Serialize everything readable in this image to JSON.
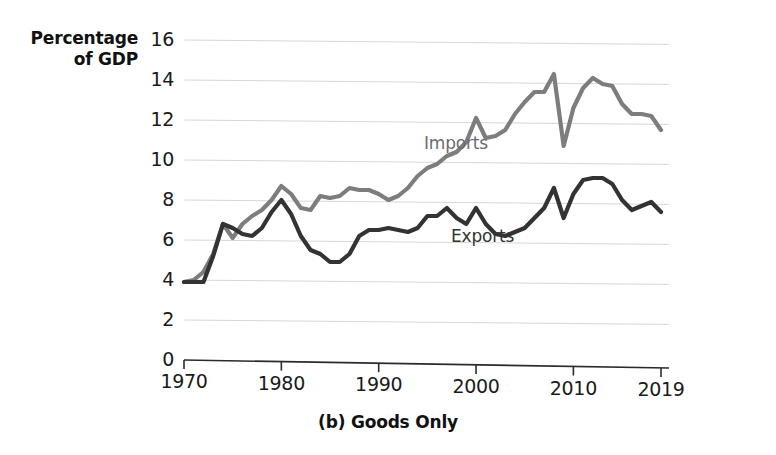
{
  "chart_data": {
    "type": "line",
    "title": "",
    "caption": "(b) Goods Only",
    "ylabel_line1": "Percentage",
    "ylabel_line2": "of GDP",
    "xlabel": "",
    "ylim": [
      0,
      16
    ],
    "xlim": [
      1970,
      2019
    ],
    "grid": true,
    "grid_axis": "y",
    "legend_position": "inline-annotation",
    "ytick_labels": [
      "16",
      "14",
      "12",
      "10",
      "8",
      "6",
      "4",
      "2",
      "0"
    ],
    "ytick_values": [
      16,
      14,
      12,
      10,
      8,
      6,
      4,
      2,
      0
    ],
    "xtick_labels": [
      "1970",
      "1980",
      "1990",
      "2000",
      "2010",
      "2019"
    ],
    "xtick_values": [
      1970,
      1980,
      1990,
      2000,
      2010,
      2019
    ],
    "x": [
      1970,
      1971,
      1972,
      1973,
      1974,
      1975,
      1976,
      1977,
      1978,
      1979,
      1980,
      1981,
      1982,
      1983,
      1984,
      1985,
      1986,
      1987,
      1988,
      1989,
      1990,
      1991,
      1992,
      1993,
      1994,
      1995,
      1996,
      1997,
      1998,
      1999,
      2000,
      2001,
      2002,
      2003,
      2004,
      2005,
      2006,
      2007,
      2008,
      2009,
      2010,
      2011,
      2012,
      2013,
      2014,
      2015,
      2016,
      2017,
      2018,
      2019
    ],
    "series": [
      {
        "name": "Imports",
        "color": "#7d7d7d",
        "values": [
          3.9,
          4.0,
          4.4,
          5.3,
          6.8,
          6.1,
          6.8,
          7.2,
          7.5,
          8.0,
          8.7,
          8.3,
          7.6,
          7.5,
          8.2,
          8.1,
          8.2,
          8.6,
          8.5,
          8.5,
          8.3,
          8.0,
          8.2,
          8.6,
          9.2,
          9.6,
          9.8,
          10.2,
          10.4,
          10.9,
          12.1,
          11.1,
          11.2,
          11.5,
          12.3,
          12.9,
          13.4,
          13.4,
          14.3,
          10.7,
          12.6,
          13.6,
          14.1,
          13.8,
          13.7,
          12.8,
          12.3,
          12.3,
          12.2,
          11.5
        ]
      },
      {
        "name": "Exports",
        "color": "#333333",
        "values": [
          3.9,
          3.9,
          3.9,
          5.2,
          6.8,
          6.6,
          6.3,
          6.2,
          6.6,
          7.4,
          8.0,
          7.3,
          6.2,
          5.5,
          5.3,
          4.9,
          4.9,
          5.3,
          6.2,
          6.5,
          6.5,
          6.6,
          6.5,
          6.4,
          6.6,
          7.2,
          7.2,
          7.6,
          7.1,
          6.8,
          7.6,
          6.8,
          6.3,
          6.2,
          6.4,
          6.6,
          7.1,
          7.6,
          8.6,
          7.1,
          8.3,
          9.0,
          9.1,
          9.1,
          8.8,
          8.0,
          7.5,
          7.7,
          7.9,
          7.4
        ]
      }
    ],
    "annotations": [
      {
        "text": "Imports",
        "series": "Imports",
        "x_px": 424,
        "y_px": 135
      },
      {
        "text": "Exports",
        "series": "Exports",
        "x_px": 451,
        "y_px": 228
      }
    ]
  }
}
